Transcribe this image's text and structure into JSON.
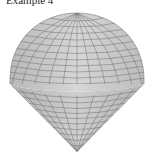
{
  "title": "Example 4",
  "figure": {
    "shape": "sphere-cone (ice-cream cone surface)",
    "mesh_color": "#5a5a5a",
    "fill_color": "#c8c8c8",
    "shade_color": "#a8a8a8"
  }
}
